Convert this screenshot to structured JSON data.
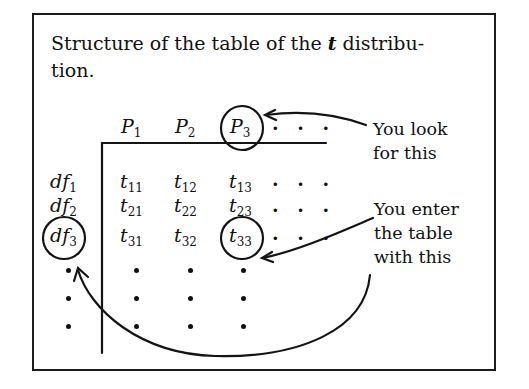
{
  "caption": {
    "text_before": "Structure of the table of the ",
    "t_symbol": "t",
    "text_after": " distribu-\ntion."
  },
  "table": {
    "column_headers": [
      "P",
      "P",
      "P"
    ],
    "column_subscripts": [
      "1",
      "2",
      "3"
    ],
    "column_ellipsis": ". . .",
    "row_headers": [
      "df",
      "df",
      "df"
    ],
    "row_subscripts": [
      "1",
      "2",
      "3"
    ],
    "cells": [
      {
        "sym": "t",
        "sub": [
          "11",
          "12",
          "13"
        ]
      },
      {
        "sym": "t",
        "sub": [
          "21",
          "22",
          "23"
        ]
      },
      {
        "sym": "t",
        "sub": [
          "31",
          "32",
          "33"
        ]
      }
    ],
    "row_ellipsis": ". . .",
    "circled": [
      "P3",
      "df3",
      "t33"
    ]
  },
  "annotations": {
    "look": {
      "line1": "You look",
      "line2": "for this"
    },
    "enter": {
      "line1": "You enter",
      "line2": "the table",
      "line3": "with this"
    }
  },
  "colors": {
    "ink": "#141414",
    "paper": "#ffffff"
  }
}
